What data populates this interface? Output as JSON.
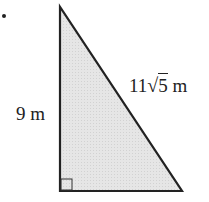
{
  "diagram": {
    "type": "right-triangle",
    "fill_color": "#e4e4e4",
    "stroke_color": "#222222",
    "vertices": {
      "top": [
        60,
        7
      ],
      "right_angle": [
        60,
        191
      ],
      "bottom_right": [
        182,
        191
      ]
    },
    "labels": {
      "vertical_leg": "9 m",
      "hypotenuse_prefix": "11",
      "hypotenuse_radical": "5",
      "hypotenuse_unit": " m"
    },
    "right_angle_marker": true
  }
}
